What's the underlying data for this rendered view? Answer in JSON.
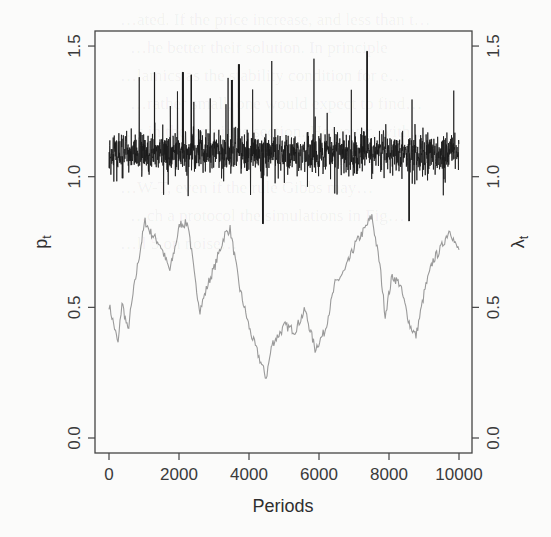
{
  "chart_data": {
    "type": "line",
    "title": "",
    "xlabel": "Periods",
    "ylabel_left": "p_t",
    "ylabel_right": "λ_t",
    "xlim": [
      -1400,
      10400
    ],
    "ylim": [
      -0.06,
      1.57
    ],
    "x_ticks": [
      0,
      2000,
      4000,
      6000,
      8000,
      10000
    ],
    "x_tick_labels": [
      "0",
      "2000",
      "4000",
      "6000",
      "8000",
      "10000"
    ],
    "y_ticks_left": [
      0.0,
      0.5,
      1.0,
      1.5
    ],
    "y_tick_labels_left": [
      "0.0",
      "0.5",
      "1.0",
      "1.5"
    ],
    "y_ticks_right": [
      0.0,
      0.5,
      1.0,
      1.5
    ],
    "y_tick_labels_right": [
      "0.0",
      "0.5",
      "1.0",
      "1.5"
    ],
    "grid": false,
    "legend": null,
    "series": [
      {
        "name": "p_t",
        "axis": "left",
        "color": "#1a1a1a",
        "style": "noisy",
        "description": "High-frequency series fluctuating around ~1.09 over periods 0–10000",
        "mean": 1.09,
        "min_approx": 0.82,
        "max_approx": 1.48,
        "n_points": 10000,
        "notable_spikes": [
          {
            "x": 1300,
            "y": 1.4
          },
          {
            "x": 2100,
            "y": 1.4
          },
          {
            "x": 2350,
            "y": 1.39
          },
          {
            "x": 3700,
            "y": 1.43
          },
          {
            "x": 3500,
            "y": 1.37
          },
          {
            "x": 7380,
            "y": 1.48
          },
          {
            "x": 9850,
            "y": 1.33
          },
          {
            "x": 4400,
            "y": 0.82
          },
          {
            "x": 8580,
            "y": 0.83
          }
        ]
      },
      {
        "name": "λ_t",
        "axis": "right",
        "color": "#9a9a9a",
        "style": "line",
        "x": [
          0,
          110,
          260,
          370,
          540,
          710,
          890,
          1030,
          1170,
          1460,
          1740,
          2030,
          2260,
          2460,
          2600,
          2830,
          3030,
          3310,
          3460,
          3740,
          4030,
          4310,
          4490,
          4660,
          5030,
          5310,
          5600,
          5890,
          6170,
          6460,
          6740,
          7030,
          7310,
          7510,
          7740,
          7890,
          8090,
          8310,
          8600,
          8770,
          9030,
          9260,
          9460,
          9740,
          9890,
          10000
        ],
        "values": [
          0.51,
          0.45,
          0.36,
          0.52,
          0.41,
          0.57,
          0.72,
          0.83,
          0.79,
          0.74,
          0.64,
          0.82,
          0.82,
          0.6,
          0.49,
          0.59,
          0.66,
          0.78,
          0.8,
          0.57,
          0.41,
          0.3,
          0.23,
          0.36,
          0.43,
          0.41,
          0.49,
          0.34,
          0.41,
          0.59,
          0.64,
          0.74,
          0.8,
          0.85,
          0.66,
          0.47,
          0.62,
          0.59,
          0.43,
          0.39,
          0.57,
          0.68,
          0.72,
          0.8,
          0.74,
          0.72
        ]
      }
    ]
  },
  "layout": {
    "plot_left": 95,
    "plot_right": 472,
    "plot_top": 31,
    "plot_bottom": 453,
    "x0_px": 109,
    "x_px_per_unit": 0.035,
    "y0_px": 438,
    "y_px_per_unit": 261.3
  },
  "background_text": [
    "…ated. If the price increase, and less than t…",
    "…he better their solution. In principle",
    "…lamics as the stability condition for e…",
    "…rather small, one would expect to find…",
    "…s in the previous section. However, with…",
    "…the power of better heuristics, the fee…",
    "…W-T, even if the rule Gibbs may…",
    "…ch a protocol the simulations in Fig…",
    "…ll 5 on noise…"
  ]
}
